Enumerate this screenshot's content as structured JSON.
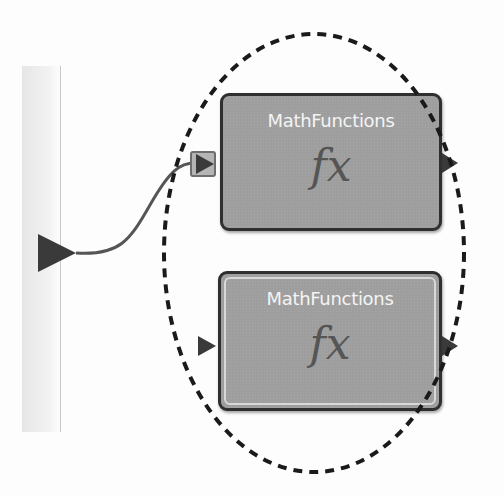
{
  "diagram": {
    "blocks": [
      {
        "title": "MathFunctions",
        "icon": "fx",
        "icon_name": "function-fx-icon",
        "state": "selected-connected"
      },
      {
        "title": "MathFunctions",
        "icon": "fx",
        "icon_name": "function-fx-icon",
        "state": "highlighted"
      }
    ],
    "annotation": {
      "shape": "dashed-ellipse",
      "color": "#1a1a1a"
    },
    "colors": {
      "block_fill": "#9e9e9e",
      "block_border": "#2f2f2f",
      "wire": "#555555",
      "port": "#3a3a3a",
      "rail": "#e6e6e6"
    }
  }
}
